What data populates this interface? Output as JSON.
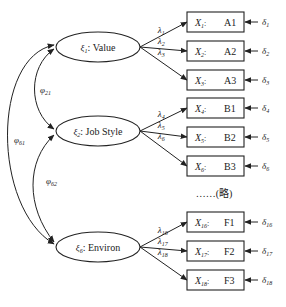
{
  "diagram": {
    "type": "structural-equation-model",
    "latent_factors": [
      {
        "id": "xi1",
        "symbol": "ξ",
        "sub": "1",
        "name": "Value",
        "cx": 98,
        "cy": 47
      },
      {
        "id": "xi2",
        "symbol": "ξ",
        "sub": "2",
        "name": "Job Style",
        "cx": 98,
        "cy": 131
      },
      {
        "id": "xi6",
        "symbol": "ξ",
        "sub": "6",
        "name": "Environ",
        "cx": 98,
        "cy": 247
      }
    ],
    "indicators": [
      {
        "factor": "xi1",
        "var": "X",
        "sub": "1",
        "code": "A1",
        "y": 22,
        "lambda": "1",
        "delta": "1"
      },
      {
        "factor": "xi1",
        "var": "X",
        "sub": "2",
        "code": "A2",
        "y": 51,
        "lambda": "2",
        "delta": "2"
      },
      {
        "factor": "xi1",
        "var": "X",
        "sub": "3",
        "code": "A3",
        "y": 80,
        "lambda": "3",
        "delta": "3"
      },
      {
        "factor": "xi2",
        "var": "X",
        "sub": "4",
        "code": "B1",
        "y": 108,
        "lambda": "4",
        "delta": "4"
      },
      {
        "factor": "xi2",
        "var": "X",
        "sub": "5",
        "code": "B2",
        "y": 137,
        "lambda": "5",
        "delta": "5"
      },
      {
        "factor": "xi2",
        "var": "X",
        "sub": "6",
        "code": "B3",
        "y": 166,
        "lambda": "6",
        "delta": "6"
      },
      {
        "factor": "xi6",
        "var": "X",
        "sub": "16",
        "code": "F1",
        "y": 222,
        "lambda": "16",
        "delta": "16"
      },
      {
        "factor": "xi6",
        "var": "X",
        "sub": "17",
        "code": "F2",
        "y": 251,
        "lambda": "17",
        "delta": "17"
      },
      {
        "factor": "xi6",
        "var": "X",
        "sub": "18",
        "code": "F3",
        "y": 280,
        "lambda": "18",
        "delta": "18"
      }
    ],
    "covariances": [
      {
        "symbol": "φ",
        "sub": "21",
        "from": "xi1",
        "to": "xi2"
      },
      {
        "symbol": "φ",
        "sub": "61",
        "from": "xi1",
        "to": "xi6"
      },
      {
        "symbol": "φ",
        "sub": "62",
        "from": "xi2",
        "to": "xi6"
      }
    ],
    "ellipsis_note": "……(略)",
    "symbols": {
      "lambda": "λ",
      "delta": "δ",
      "separator": ":"
    }
  }
}
